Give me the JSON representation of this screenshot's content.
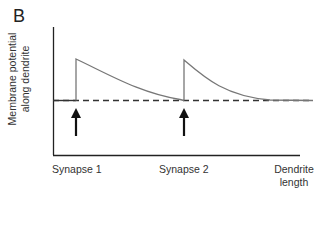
{
  "panel": {
    "label": "B"
  },
  "axes": {
    "ylabel_line1": "Membrane potential",
    "ylabel_line2": "along dendrite",
    "x_ticks": [
      "Synapse 1",
      "Synapse 2"
    ],
    "xlabel_line1": "Dendrite",
    "xlabel_line2": "length"
  },
  "colors": {
    "curve": "#777777",
    "axis": "#222222",
    "arrow": "#111111",
    "baseline": "#333333"
  },
  "diagram": {
    "type": "line",
    "events": [
      {
        "label": "Synapse 1",
        "arrow": "up-arrow"
      },
      {
        "label": "Synapse 2",
        "arrow": "up-arrow"
      }
    ],
    "baseline_style": "dashed"
  }
}
